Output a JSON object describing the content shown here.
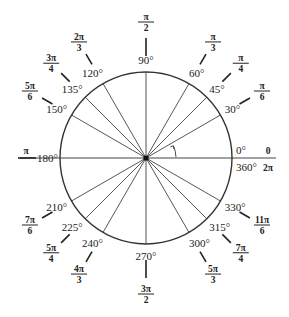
{
  "diagram": {
    "center": [
      146,
      158
    ],
    "radius": 86,
    "colors": {
      "stroke": "#333333",
      "text": "#222222",
      "background": "#ffffff"
    },
    "angles": [
      {
        "deg": 0,
        "deg_label": "0°",
        "rad_num": "0",
        "rad_den": ""
      },
      {
        "deg": 30,
        "deg_label": "30°",
        "rad_num": "π",
        "rad_den": "6"
      },
      {
        "deg": 45,
        "deg_label": "45°",
        "rad_num": "π",
        "rad_den": "4"
      },
      {
        "deg": 60,
        "deg_label": "60°",
        "rad_num": "π",
        "rad_den": "3"
      },
      {
        "deg": 90,
        "deg_label": "90°",
        "rad_num": "π",
        "rad_den": "2"
      },
      {
        "deg": 120,
        "deg_label": "120°",
        "rad_num": "2π",
        "rad_den": "3"
      },
      {
        "deg": 135,
        "deg_label": "135°",
        "rad_num": "3π",
        "rad_den": "4"
      },
      {
        "deg": 150,
        "deg_label": "150°",
        "rad_num": "5π",
        "rad_den": "6"
      },
      {
        "deg": 180,
        "deg_label": "180°",
        "rad_num": "π",
        "rad_den": ""
      },
      {
        "deg": 210,
        "deg_label": "210°",
        "rad_num": "7π",
        "rad_den": "6"
      },
      {
        "deg": 225,
        "deg_label": "225°",
        "rad_num": "5π",
        "rad_den": "4"
      },
      {
        "deg": 240,
        "deg_label": "240°",
        "rad_num": "4π",
        "rad_den": "3"
      },
      {
        "deg": 270,
        "deg_label": "270°",
        "rad_num": "3π",
        "rad_den": "2"
      },
      {
        "deg": 300,
        "deg_label": "300°",
        "rad_num": "5π",
        "rad_den": "3"
      },
      {
        "deg": 315,
        "deg_label": "315°",
        "rad_num": "7π",
        "rad_den": "4"
      },
      {
        "deg": 330,
        "deg_label": "330°",
        "rad_num": "11π",
        "rad_den": "6"
      }
    ],
    "full_turn": {
      "deg_label": "360°",
      "rad_label": "2π"
    }
  }
}
